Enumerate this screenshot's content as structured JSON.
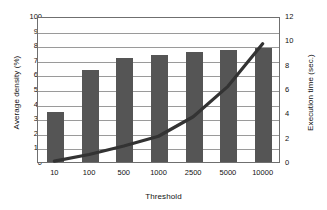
{
  "chart_data": {
    "type": "bar",
    "title": "",
    "xlabel": "Threshold",
    "categories": [
      "10",
      "100",
      "500",
      "1000",
      "2500",
      "5000",
      "10000"
    ],
    "grid": true,
    "legend": "none",
    "series": [
      {
        "name": "Average density (%)",
        "type": "bar",
        "axis": "left",
        "values": [
          34,
          63,
          71,
          73,
          75.5,
          77,
          78
        ],
        "color": "#555555"
      },
      {
        "name": "Execution time (sec.)",
        "type": "line",
        "axis": "right",
        "values": [
          0.15,
          0.7,
          1.4,
          2.2,
          3.8,
          6.3,
          9.8
        ],
        "color": "#333333"
      }
    ],
    "axes": {
      "left": {
        "label": "Average density (%)",
        "ticks": [
          "0",
          "10",
          "20",
          "30",
          "40",
          "50",
          "60",
          "70",
          "80",
          "90",
          "100"
        ],
        "min": 0,
        "max": 100
      },
      "right": {
        "label": "Execution time (sec.)",
        "ticks": [
          "0",
          "2",
          "4",
          "6",
          "8",
          "10",
          "12"
        ],
        "min": 0,
        "max": 12
      },
      "x": {
        "label": "Threshold",
        "ticks": [
          "10",
          "100",
          "500",
          "1000",
          "2500",
          "5000",
          "10000"
        ]
      }
    }
  }
}
